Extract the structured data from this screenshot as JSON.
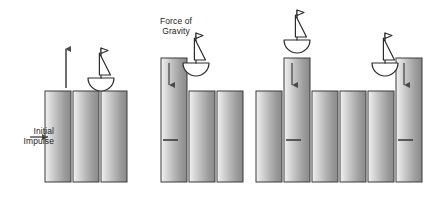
{
  "diagram": {
    "background_color": "#ffffff",
    "width": 431,
    "height": 200,
    "labels": {
      "gravity": "Force of\nGravity",
      "impulse": "Initial\nImpulse"
    },
    "colors": {
      "column_light": "#efefef",
      "column_mid": "#c9c9c9",
      "column_dark": "#8d8d8d",
      "column_outline": "#3b3b3b",
      "arrow": "#4a4a4a",
      "boat_stroke": "#2b2b2b",
      "text": "#1a1a1a"
    },
    "geometry": {
      "baseline_y": 182,
      "rest_top_y": 91,
      "column_width": 26,
      "column_gap": 2
    },
    "panels": [
      {
        "name": "panel-1-initial-impulse",
        "index": 1,
        "x": 45,
        "columns": [
          {
            "name": "column-a",
            "offset": 0,
            "top_y": 91,
            "raised": false,
            "arrow": null,
            "tick": false
          },
          {
            "name": "column-b",
            "offset": 28,
            "top_y": 91,
            "raised": false,
            "arrow": null,
            "tick": false
          },
          {
            "name": "column-c",
            "offset": 56,
            "top_y": 91,
            "raised": false,
            "arrow": null,
            "tick": false
          }
        ],
        "boat": {
          "name": "boat",
          "cx": 101,
          "cy": 78,
          "scale": 1.0
        },
        "up_arrow": {
          "name": "up-arrow-impulse",
          "x": 66,
          "y_top": 49,
          "y_bottom": 88
        },
        "impulse_arrow": {
          "name": "impulse-arrow",
          "x_start": 30,
          "x_end": 48,
          "y": 137
        }
      },
      {
        "name": "panel-2-first-column-rises",
        "index": 2,
        "x": 161,
        "columns": [
          {
            "name": "column-a",
            "offset": 0,
            "top_y": 58,
            "raised": true,
            "arrow": "down",
            "tick": true
          },
          {
            "name": "column-b",
            "offset": 28,
            "top_y": 91,
            "raised": false,
            "arrow": null,
            "tick": false
          },
          {
            "name": "column-c",
            "offset": 56,
            "top_y": 91,
            "raised": false,
            "arrow": null,
            "tick": false
          }
        ],
        "boat": {
          "name": "boat",
          "cx": 196,
          "cy": 63,
          "scale": 1.0
        }
      },
      {
        "name": "panel-3-middle-column-peak",
        "index": 3,
        "x": 256,
        "columns": [
          {
            "name": "column-a",
            "offset": 0,
            "top_y": 91,
            "raised": false,
            "arrow": null,
            "tick": false
          },
          {
            "name": "column-b",
            "offset": 28,
            "top_y": 58,
            "raised": true,
            "arrow": "down",
            "tick": true
          },
          {
            "name": "column-c",
            "offset": 56,
            "top_y": 91,
            "raised": false,
            "arrow": null,
            "tick": false
          }
        ],
        "boat": {
          "name": "boat",
          "cx": 297,
          "cy": 40,
          "scale": 1.0
        }
      },
      {
        "name": "panel-4-last-column-rises",
        "index": 4,
        "x": 340,
        "columns": [
          {
            "name": "column-a",
            "offset": 0,
            "top_y": 91,
            "raised": false,
            "arrow": null,
            "tick": false
          },
          {
            "name": "column-b",
            "offset": 28,
            "top_y": 91,
            "raised": false,
            "arrow": null,
            "tick": false
          },
          {
            "name": "column-c",
            "offset": 56,
            "top_y": 58,
            "raised": true,
            "arrow": "down",
            "tick": true
          }
        ],
        "boat": {
          "name": "boat",
          "cx": 385,
          "cy": 63,
          "scale": 1.0
        }
      }
    ]
  }
}
